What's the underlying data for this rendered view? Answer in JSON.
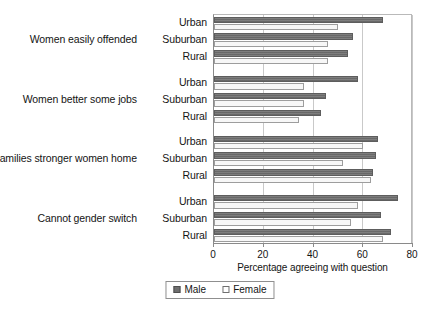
{
  "chart_data": {
    "type": "bar",
    "orientation": "horizontal",
    "title": "",
    "xlabel": "Percentage agreeing with question",
    "ylabel": "",
    "xlim": [
      0,
      80
    ],
    "xticks": [
      0,
      20,
      40,
      60,
      80
    ],
    "xtick_labels": [
      "0",
      "20",
      "40",
      "60",
      "80"
    ],
    "grid": true,
    "legend_position": "bottom",
    "legend": [
      "Male",
      "Female"
    ],
    "series": [
      {
        "name": "Male",
        "color": "#6f6f6f",
        "values": [
          68,
          56,
          54,
          58,
          45,
          43,
          66,
          65,
          64,
          74,
          67,
          71
        ]
      },
      {
        "name": "Female",
        "color": "#f7f7f7",
        "values": [
          50,
          46,
          46,
          36,
          36,
          34,
          60,
          52,
          63,
          58,
          55,
          68
        ]
      }
    ],
    "categories": [
      "Urban",
      "Suburban",
      "Rural",
      "Urban",
      "Suburban",
      "Rural",
      "Urban",
      "Suburban",
      "Rural",
      "Urban",
      "Suburban",
      "Rural"
    ],
    "groups": [
      {
        "label": "Women easily offended",
        "rows": [
          {
            "label": "Urban",
            "male": 68,
            "female": 50
          },
          {
            "label": "Suburban",
            "male": 56,
            "female": 46
          },
          {
            "label": "Rural",
            "male": 54,
            "female": 46
          }
        ]
      },
      {
        "label": "Women better some jobs",
        "rows": [
          {
            "label": "Urban",
            "male": 58,
            "female": 36
          },
          {
            "label": "Suburban",
            "male": 45,
            "female": 36
          },
          {
            "label": "Rural",
            "male": 43,
            "female": 34
          }
        ]
      },
      {
        "label": "Families stronger women home",
        "rows": [
          {
            "label": "Urban",
            "male": 66,
            "female": 60
          },
          {
            "label": "Suburban",
            "male": 65,
            "female": 52
          },
          {
            "label": "Rural",
            "male": 64,
            "female": 63
          }
        ]
      },
      {
        "label": "Cannot gender switch",
        "rows": [
          {
            "label": "Urban",
            "male": 74,
            "female": 58
          },
          {
            "label": "Suburban",
            "male": 67,
            "female": 55
          },
          {
            "label": "Rural",
            "male": 71,
            "female": 68
          }
        ]
      }
    ]
  },
  "legend": {
    "male_label": "Male",
    "female_label": "Female"
  },
  "axis": {
    "title": "Percentage agreeing with question",
    "ticks": [
      "0",
      "20",
      "40",
      "60",
      "80"
    ]
  }
}
